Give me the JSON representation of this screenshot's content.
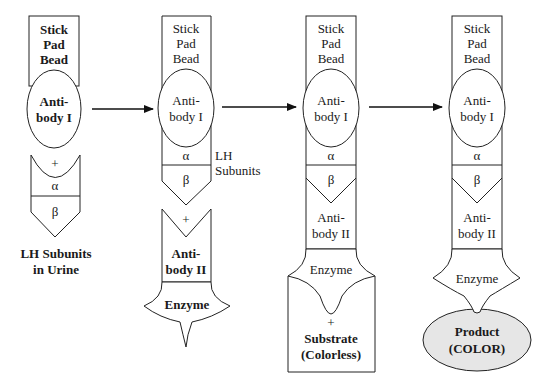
{
  "diagram": {
    "colors": {
      "stroke": "#222222",
      "background": "#ffffff",
      "product_fill": "#e6e6e6"
    },
    "arrows": [
      {
        "from": "step1",
        "to": "step2"
      },
      {
        "from": "step2",
        "to": "step3"
      },
      {
        "from": "step3",
        "to": "step4"
      }
    ],
    "step1": {
      "support": [
        "Stick",
        "Pad",
        "Bead"
      ],
      "antibody": [
        "Anti-",
        "body I"
      ],
      "plus": "+",
      "alpha": "α",
      "beta": "β",
      "caption": [
        "LH Subunits",
        "in Urine"
      ]
    },
    "step2": {
      "support": [
        "Stick",
        "Pad",
        "Bead"
      ],
      "antibody": [
        "Anti-",
        "body I"
      ],
      "alpha": "α",
      "beta": "β",
      "side_label": [
        "LH",
        "Subunits"
      ],
      "plus": "+",
      "antibody2": [
        "Anti-",
        "body II"
      ],
      "enzyme": "Enzyme"
    },
    "step3": {
      "support": [
        "Stick",
        "Pad",
        "Bead"
      ],
      "antibody": [
        "Anti-",
        "body I"
      ],
      "alpha": "α",
      "beta": "β",
      "antibody2": [
        "Anti-",
        "body II"
      ],
      "enzyme": "Enzyme",
      "plus": "+",
      "substrate": [
        "Substrate",
        "(Colorless)"
      ]
    },
    "step4": {
      "support": [
        "Stick",
        "Pad",
        "Bead"
      ],
      "antibody": [
        "Anti-",
        "body I"
      ],
      "alpha": "α",
      "beta": "β",
      "antibody2": [
        "Anti-",
        "body II"
      ],
      "enzyme": "Enzyme",
      "product": [
        "Product",
        "(COLOR)"
      ]
    }
  }
}
